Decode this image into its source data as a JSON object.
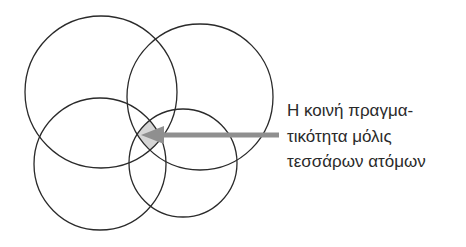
{
  "diagram": {
    "type": "venn-4-circles",
    "circles": [
      {
        "id": "top-left",
        "cx": 101,
        "cy": 92,
        "r": 76
      },
      {
        "id": "top-right",
        "cx": 200,
        "cy": 97,
        "r": 73
      },
      {
        "id": "bottom-left",
        "cx": 100,
        "cy": 164,
        "r": 66
      },
      {
        "id": "bottom-right",
        "cx": 183,
        "cy": 163,
        "r": 54
      }
    ],
    "stroke_color": "#2a2a2a",
    "highlight_color": "#d6d6d6",
    "arrow_color": "#8f8f8f",
    "annotation": {
      "lines": [
        "Η κοινή πραγμα-",
        "τικότητα μόλις",
        "τεσσάρων ατόμων"
      ]
    }
  }
}
